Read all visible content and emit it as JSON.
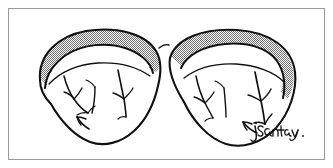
{
  "figure": {
    "title": "Cerebellar tonsils / paired lobes - line illustration",
    "background_color": "#ffffff",
    "frame": {
      "visible": true,
      "color": "#9a9a9a",
      "stroke_width": 1,
      "inset_left": 8,
      "inset_top": 8,
      "inset_right": 9,
      "inset_bottom": 9
    },
    "ink_color": "#101010",
    "stipple": {
      "pattern": "checkerboard-halftone",
      "fill_color": "#6f6f6f",
      "background": "#ffffff",
      "cell_px": 2,
      "coverage_label": "50%"
    },
    "signature": {
      "text": "jsantay",
      "trailing_mark": ".",
      "style": "handwritten-script",
      "color": "#141414",
      "position_label": "bottom-right"
    },
    "parts": [
      {
        "name": "left-lobe",
        "label": "Left lobe",
        "shaded_band": "superior-posterior rim"
      },
      {
        "name": "right-lobe",
        "label": "Right lobe",
        "shaded_band": "superior-posterior rim"
      },
      {
        "name": "left-lobe-fissures",
        "label": "Left lobe fissure branches",
        "count": 3
      },
      {
        "name": "right-lobe-fissures",
        "label": "Right lobe fissure branches",
        "count": 3
      },
      {
        "name": "midline-contact",
        "label": "Midline contact point"
      }
    ]
  }
}
